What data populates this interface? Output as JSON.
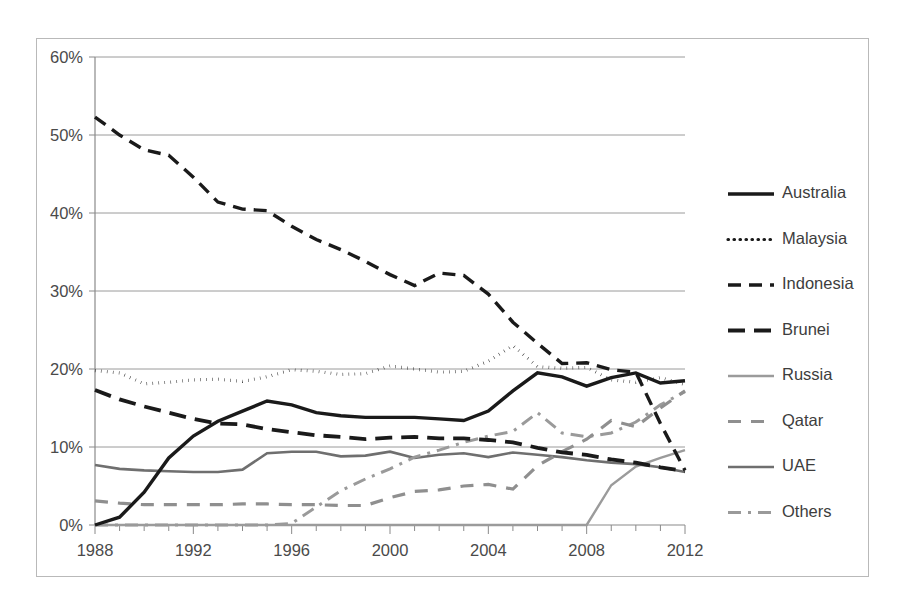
{
  "chart_data": {
    "type": "line",
    "title": "",
    "subtitle": "",
    "xlabel": "",
    "ylabel": "",
    "x": [
      1988,
      1989,
      1990,
      1991,
      1992,
      1993,
      1994,
      1995,
      1996,
      1997,
      1998,
      1999,
      2000,
      2001,
      2002,
      2003,
      2004,
      2005,
      2006,
      2007,
      2008,
      2009,
      2010,
      2011,
      2012
    ],
    "xlim": [
      1988,
      2012
    ],
    "ylim": [
      0,
      60
    ],
    "ytick_labels": [
      "0%",
      "10%",
      "20%",
      "30%",
      "40%",
      "50%",
      "60%"
    ],
    "ytick_values": [
      0,
      10,
      20,
      30,
      40,
      50,
      60
    ],
    "xtick_labels": [
      "1988",
      "1992",
      "1996",
      "2000",
      "2004",
      "2008",
      "2012"
    ],
    "xtick_values": [
      1988,
      1992,
      1996,
      2000,
      2004,
      2008,
      2012
    ],
    "xminor_step": 1,
    "grid": "horizontal",
    "legend_position": "right",
    "series": [
      {
        "name": "Australia",
        "style": "solid",
        "color": "#1a1a1a",
        "width": 3.4,
        "dash": "",
        "values": [
          0.0,
          1.0,
          4.2,
          8.6,
          11.4,
          13.3,
          14.6,
          15.9,
          15.4,
          14.4,
          14.0,
          13.8,
          13.8,
          13.8,
          13.6,
          13.4,
          14.6,
          17.2,
          19.5,
          19.0,
          17.8,
          18.9,
          19.5,
          18.2,
          18.5
        ]
      },
      {
        "name": "Malaysia",
        "style": "dotted",
        "color": "#1a1a1a",
        "width": 3.2,
        "dash": "0.5,5.5",
        "values": [
          19.8,
          19.5,
          18.1,
          18.3,
          18.6,
          18.7,
          18.4,
          19.0,
          19.9,
          19.7,
          19.3,
          19.4,
          20.4,
          20.0,
          19.6,
          19.7,
          21.0,
          23.0,
          20.3,
          20.1,
          20.2,
          18.6,
          18.3,
          18.9,
          18.0
        ]
      },
      {
        "name": "Indonesia",
        "style": "dashed",
        "color": "#1a1a1a",
        "width": 3.4,
        "dash": "13,8",
        "values": [
          52.3,
          50.0,
          48.1,
          47.4,
          44.6,
          41.4,
          40.5,
          40.3,
          38.3,
          36.6,
          35.3,
          33.8,
          32.1,
          30.7,
          32.3,
          32.0,
          29.6,
          26.0,
          23.3,
          20.7,
          20.8,
          19.9,
          19.6,
          13.0,
          7.0
        ]
      },
      {
        "name": "Brunei",
        "style": "long-dash",
        "color": "#1a1a1a",
        "width": 3.8,
        "dash": "17,9",
        "values": [
          17.3,
          16.1,
          15.2,
          14.4,
          13.6,
          13.0,
          12.9,
          12.3,
          11.9,
          11.5,
          11.3,
          11.0,
          11.2,
          11.3,
          11.1,
          11.1,
          10.9,
          10.6,
          9.9,
          9.3,
          9.0,
          8.4,
          8.0,
          7.4,
          6.9
        ]
      },
      {
        "name": "Russia",
        "style": "solid-thin",
        "color": "#9b9b9b",
        "width": 2.4,
        "dash": "",
        "values": [
          0.0,
          0.0,
          0.0,
          0.0,
          0.0,
          0.0,
          0.0,
          0.0,
          0.0,
          0.0,
          0.0,
          0.0,
          0.0,
          0.0,
          0.0,
          0.0,
          0.0,
          0.0,
          0.0,
          0.0,
          0.0,
          5.1,
          7.5,
          8.6,
          9.6
        ]
      },
      {
        "name": "Qatar",
        "style": "dashed-gray",
        "color": "#8f8f8f",
        "width": 3.2,
        "dash": "13,10",
        "values": [
          3.1,
          2.8,
          2.6,
          2.6,
          2.6,
          2.6,
          2.7,
          2.7,
          2.6,
          2.6,
          2.5,
          2.5,
          3.5,
          4.3,
          4.5,
          5.0,
          5.2,
          4.6,
          7.6,
          9.4,
          11.0,
          13.4,
          12.6,
          15.0,
          17.2
        ]
      },
      {
        "name": "UAE",
        "style": "solid-gray",
        "color": "#6f6f6f",
        "width": 2.6,
        "dash": "",
        "values": [
          7.7,
          7.2,
          7.0,
          6.9,
          6.8,
          6.8,
          7.1,
          9.2,
          9.4,
          9.4,
          8.8,
          8.9,
          9.4,
          8.6,
          9.0,
          9.2,
          8.7,
          9.3,
          9.0,
          8.7,
          8.3,
          8.0,
          7.8,
          7.4,
          6.8
        ]
      },
      {
        "name": "Others",
        "style": "dash-dot-gray",
        "color": "#9a9a9a",
        "width": 3.0,
        "dash": "13,7,3,7",
        "values": [
          0.0,
          0.0,
          0.0,
          0.0,
          0.0,
          0.0,
          0.0,
          0.0,
          0.2,
          2.3,
          4.4,
          5.9,
          7.2,
          8.7,
          9.6,
          10.6,
          11.4,
          12.0,
          14.4,
          11.8,
          11.3,
          11.8,
          13.2,
          15.4,
          17.1
        ]
      }
    ]
  },
  "legend": {
    "entries": [
      {
        "label": "Australia"
      },
      {
        "label": "Malaysia"
      },
      {
        "label": "Indonesia"
      },
      {
        "label": "Brunei"
      },
      {
        "label": "Russia"
      },
      {
        "label": "Qatar"
      },
      {
        "label": "UAE"
      },
      {
        "label": "Others"
      }
    ]
  }
}
